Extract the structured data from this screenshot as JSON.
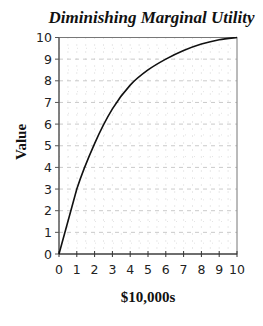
{
  "chart_data": {
    "type": "line",
    "title": "Diminishing Marginal Utility",
    "xlabel": "$10,000s",
    "ylabel": "Value",
    "x": [
      0,
      1,
      2,
      3,
      4,
      5,
      6,
      7,
      8,
      9,
      10
    ],
    "series": [
      {
        "name": "Value",
        "values": [
          0,
          3.0,
          5.1,
          6.7,
          7.8,
          8.5,
          9.0,
          9.4,
          9.7,
          9.9,
          10.0
        ],
        "color": "#111111"
      }
    ],
    "xlim": [
      0,
      10
    ],
    "ylim": [
      0,
      10
    ],
    "xticks": [
      "0",
      "1",
      "2",
      "3",
      "4",
      "5",
      "6",
      "7",
      "8",
      "9",
      "10"
    ],
    "yticks": [
      "0",
      "1",
      "2",
      "3",
      "4",
      "5",
      "6",
      "7",
      "8",
      "9",
      "10"
    ],
    "grid": true,
    "legend": "none"
  }
}
